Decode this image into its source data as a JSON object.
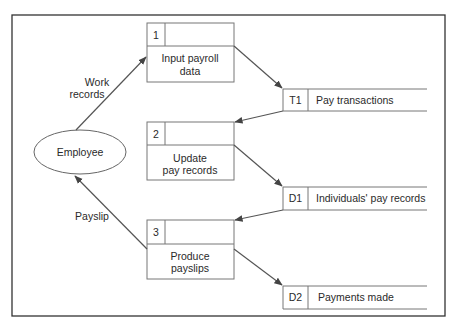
{
  "diagram": {
    "type": "data-flow-diagram",
    "external_entity": {
      "label": "Employee"
    },
    "processes": [
      {
        "id": "1",
        "line1": "Input payroll",
        "line2": "data"
      },
      {
        "id": "2",
        "line1": "Update",
        "line2": "pay records"
      },
      {
        "id": "3",
        "line1": "Produce",
        "line2": "payslips"
      }
    ],
    "data_stores": [
      {
        "id": "T1",
        "label": "Pay transactions"
      },
      {
        "id": "D1",
        "label": "Individuals' pay records"
      },
      {
        "id": "D2",
        "label": "Payments made"
      }
    ],
    "flows": [
      {
        "from": "Employee",
        "to": "1",
        "line1": "Work",
        "line2": "records"
      },
      {
        "from": "3",
        "to": "Employee",
        "label": "Payslip"
      },
      {
        "from": "1",
        "to": "T1"
      },
      {
        "from": "T1",
        "to": "2"
      },
      {
        "from": "2",
        "to": "D1"
      },
      {
        "from": "D1",
        "to": "3"
      },
      {
        "from": "3",
        "to": "D2"
      }
    ],
    "colors": {
      "line": "#555555",
      "frame": "#333333",
      "background": "#ffffff"
    }
  }
}
